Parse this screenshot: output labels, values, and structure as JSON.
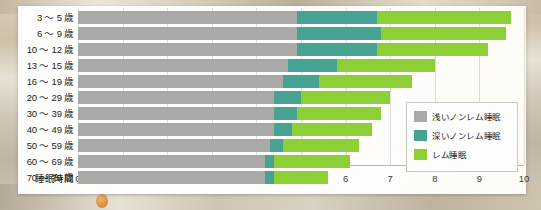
{
  "chart_data": {
    "type": "bar",
    "orientation": "horizontal",
    "stacked": true,
    "title": "",
    "xlabel": "睡眠時間",
    "ylabel": "",
    "xlim": [
      0,
      10
    ],
    "xticks": [
      0,
      1,
      2,
      3,
      4,
      5,
      6,
      7,
      8,
      9,
      10
    ],
    "xtick_labels": [
      "0",
      "1",
      "2",
      "3",
      "4",
      "5",
      "6",
      "7",
      "8",
      "9",
      "10"
    ],
    "grid": true,
    "legend_position": "inside-right-bottom",
    "categories": [
      "3 〜 5 歳",
      "6 〜 9 歳",
      "10 〜 12 歳",
      "13 〜 15 歳",
      "16 〜 19 歳",
      "20 〜 29 歳",
      "30 〜 39 歳",
      "40 〜 49 歳",
      "50 〜 59 歳",
      "60 〜 69 歳",
      "70 〜 79 歳"
    ],
    "series": [
      {
        "name": "浅いノンレム睡眠",
        "color": "#a9a9a7",
        "values": [
          4.9,
          4.9,
          4.9,
          4.7,
          4.6,
          4.4,
          4.4,
          4.4,
          4.3,
          4.2,
          4.2
        ]
      },
      {
        "name": "深いノンレム睡眠",
        "color": "#46a391",
        "values": [
          1.8,
          1.9,
          1.8,
          1.1,
          0.8,
          0.6,
          0.5,
          0.4,
          0.3,
          0.2,
          0.2
        ]
      },
      {
        "name": "レム睡眠",
        "color": "#8ccf36",
        "values": [
          3.0,
          2.8,
          2.5,
          2.2,
          2.1,
          2.0,
          1.9,
          1.8,
          1.7,
          1.7,
          1.2
        ]
      }
    ],
    "totals": [
      9.7,
      9.6,
      9.2,
      8.0,
      7.5,
      7.0,
      6.8,
      6.6,
      6.3,
      6.1,
      5.6
    ]
  },
  "legend": {
    "items": [
      {
        "label": "浅いノンレム睡眠",
        "swatch": "light"
      },
      {
        "label": "深いノンレム睡眠",
        "swatch": "deep"
      },
      {
        "label": "レム睡眠",
        "swatch": "rem"
      }
    ]
  },
  "colors": {
    "light_non_rem": "#a9a9a7",
    "deep_non_rem": "#46a391",
    "rem": "#8ccf36",
    "card_background": "#fdfdfb",
    "gridline": "#dcdcd8"
  }
}
